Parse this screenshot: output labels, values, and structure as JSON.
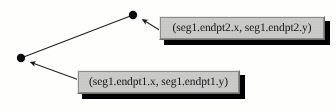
{
  "diagram": {
    "background_color": "#fdfdfb",
    "stroke_color": "#1a1a1e",
    "callout_fill_color": "#c8c8c6",
    "callout_shadow_color": "#07070a",
    "callout_border_color": "#8d8d8b",
    "text_color": "#17171a",
    "points": [
      {
        "name": "endpoint-2-dot",
        "label": "endpt2",
        "x": 133,
        "y": 15,
        "radius": 4.2
      },
      {
        "name": "endpoint-1-dot",
        "label": "endpt1",
        "x": 21,
        "y": 58,
        "radius": 4.2
      }
    ],
    "segment": {
      "name": "seg1",
      "x1": 21,
      "y1": 58,
      "x2": 133,
      "y2": 15
    },
    "leaders": [
      {
        "name": "leader-to-endpt2",
        "from_x": 161,
        "from_y": 31,
        "to_x": 140,
        "to_y": 18,
        "arrowhead": "filled-triangle"
      },
      {
        "name": "leader-to-endpt1",
        "from_x": 79,
        "from_y": 80,
        "to_x": 28,
        "to_y": 61,
        "arrowhead": "filled-triangle"
      }
    ],
    "callouts": [
      {
        "id": "endpt2",
        "text": "(seg1.endpt2.x, seg1.endpt2.y)"
      },
      {
        "id": "endpt1",
        "text": "(seg1.endpt1.x, seg1.endpt1.y)"
      }
    ]
  }
}
